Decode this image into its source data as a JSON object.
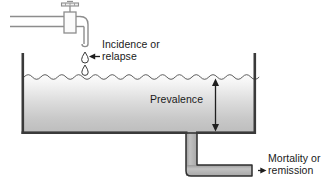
{
  "diagram": {
    "type": "conceptual-diagram",
    "labels": {
      "incidence": "Incidence or\nrelapse",
      "prevalence": "Prevalence",
      "mortality": "Mortality or\nremission"
    },
    "components": {
      "faucet": "faucet-icon",
      "pipe_supply": "supply-pipe",
      "drops": [
        "water-drop-upper",
        "water-drop-lower"
      ],
      "tank": "water-tank",
      "water_surface": "wavy-water-surface",
      "water_body": "water-fill",
      "drain_pipe": "drain-pipe",
      "prevalence_arrow": "double-headed-vertical-arrow",
      "incidence_arrow": "left-pointing-arrow",
      "mortality_arrow": "right-pointing-arrow"
    },
    "colors": {
      "stroke": "#3a3a3a",
      "faucet_stroke": "#8a8a8a",
      "water_top": "#fdfdfd",
      "water_bottom": "#b9b9b9",
      "pipe_fill": "#b0b0b0",
      "wall_fill": "#444444",
      "background": "#ffffff",
      "text": "#1a1a1a"
    },
    "geometry": {
      "tank_left": 22,
      "tank_right": 256,
      "tank_top": 53,
      "tank_bottom": 134,
      "water_line": 76,
      "drain_x": 186,
      "drain_bottom": 180
    }
  }
}
